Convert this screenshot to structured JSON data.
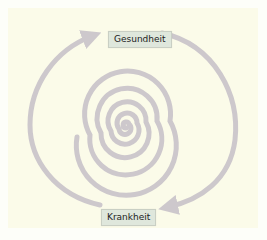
{
  "diagram": {
    "type": "spiral-cycle",
    "labels": {
      "top": "Gesundheit",
      "bottom": "Krankheit"
    },
    "colors": {
      "background": "#fbfbe9",
      "spiral": "#cdc8cc",
      "label_fill": "#dfe7dc",
      "label_border": "#c9cfc4"
    },
    "arrows": [
      {
        "from": "Gesundheit",
        "to": "Krankheit",
        "path": "outer arc clockwise (right side)"
      },
      {
        "from": "Krankheit",
        "to": "Gesundheit",
        "path": "arc counter-clockwise (left side)"
      }
    ]
  }
}
